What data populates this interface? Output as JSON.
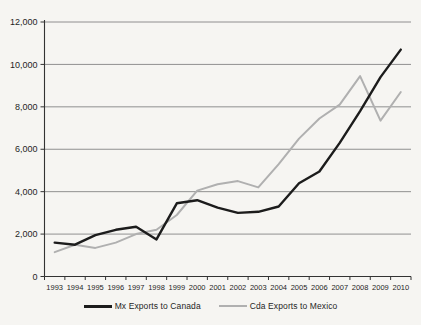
{
  "chart_data": {
    "type": "line",
    "title": "",
    "xlabel": "",
    "ylabel": "",
    "categories": [
      "1993",
      "1994",
      "1995",
      "1996",
      "1997",
      "1998",
      "1999",
      "2000",
      "2001",
      "2002",
      "2003",
      "2004",
      "2005",
      "2006",
      "2007",
      "2008",
      "2009",
      "2010"
    ],
    "series": [
      {
        "name": "Mx Exports to Canada",
        "color": "#1c1c1c",
        "stroke_width": 2.4,
        "values": [
          1600,
          1500,
          1950,
          2200,
          2350,
          1750,
          3450,
          3600,
          3250,
          3000,
          3050,
          3300,
          4400,
          4950,
          6300,
          7800,
          9400,
          10700
        ]
      },
      {
        "name": "Cda Exports to Mexico",
        "color": "#b0b0b0",
        "stroke_width": 2,
        "values": [
          1150,
          1500,
          1350,
          1600,
          2000,
          2200,
          2900,
          4050,
          4350,
          4500,
          4200,
          5300,
          6500,
          7450,
          8100,
          9450,
          7350,
          8700
        ]
      }
    ],
    "ylim": [
      0,
      12000
    ],
    "ytick_step": 2000,
    "grid": true,
    "legend_position": "bottom"
  },
  "style": {
    "background": "#f6f5f2",
    "gridline_color": "#858585",
    "axis_color": "#333333",
    "tick_color": "#333333",
    "label_color": "#1f1f1f"
  }
}
